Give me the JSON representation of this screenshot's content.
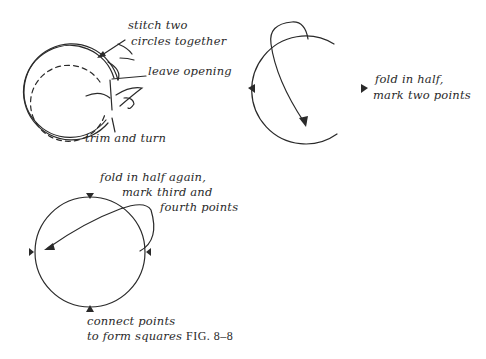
{
  "figure": {
    "caption": "FIG. 8–8",
    "steps": [
      {
        "id": "step1",
        "labels": {
          "stitch": [
            "stitch two",
            "circles together"
          ],
          "opening": "leave opening",
          "trim": "trim and turn"
        }
      },
      {
        "id": "step2",
        "labels": {
          "fold": [
            "fold in half,",
            "mark two points"
          ]
        }
      },
      {
        "id": "step3",
        "labels": {
          "fold_again": [
            "fold in half again,",
            "mark third and",
            "fourth points"
          ],
          "connect": [
            "connect points",
            "to form squares"
          ]
        }
      }
    ],
    "colors": {
      "ink": "#2a2a2a",
      "background": "#ffffff"
    }
  }
}
